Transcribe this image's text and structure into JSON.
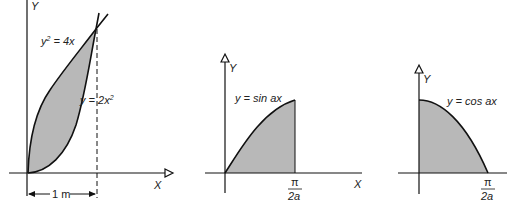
{
  "colors": {
    "fill": "#b8b8b8",
    "stroke": "#111111"
  },
  "figure1": {
    "y_axis_label": "Y",
    "x_axis_label": "X",
    "curve1_label": "y² = 4x",
    "curve1_lhs": "y",
    "curve1_exp": "2",
    "curve1_rhs": " = 4x",
    "curve2_label": "y = 2x²",
    "curve2_lhs": "y = 2x",
    "curve2_exp": "2",
    "dimension_label": "1 m"
  },
  "figure2": {
    "y_axis_label": "Y",
    "x_axis_label": "X",
    "curve_label": "y = sin ax",
    "tick_numerator": "π",
    "tick_denominator": "2a"
  },
  "figure3": {
    "y_axis_label": "Y",
    "curve_label": "y = cos ax",
    "tick_numerator": "π",
    "tick_denominator": "2a"
  }
}
